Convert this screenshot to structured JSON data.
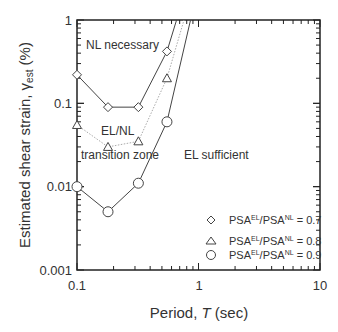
{
  "chart_data": {
    "type": "line",
    "title": "",
    "xlabel": "Period, T (sec)",
    "ylabel": "Estimated shear strain, γest (%)",
    "xscale": "log",
    "yscale": "log",
    "xlim": [
      0.1,
      10
    ],
    "ylim": [
      0.001,
      1
    ],
    "x_ticks": [
      "0.1",
      "1",
      "10"
    ],
    "y_ticks": [
      "0.001",
      "0.01",
      "0.1",
      "1"
    ],
    "grid": false,
    "legend_position": "lower right",
    "series": [
      {
        "name": "PSA^EL/PSA^NL = 0.7",
        "marker": "diamond",
        "line_color": "#444444",
        "x": [
          0.1,
          0.18,
          0.32,
          0.55,
          0.66
        ],
        "y": [
          0.22,
          0.09,
          0.09,
          0.42,
          1.0
        ]
      },
      {
        "name": "PSA^EL/PSA^NL = 0.8",
        "marker": "triangle",
        "line_color": "#aaaaaa",
        "line_style": "dotted",
        "x": [
          0.1,
          0.18,
          0.32,
          0.55,
          0.76
        ],
        "y": [
          0.055,
          0.03,
          0.035,
          0.2,
          1.0
        ]
      },
      {
        "name": "PSA^EL/PSA^NL = 0.9",
        "marker": "circle",
        "line_color": "#444444",
        "x": [
          0.1,
          0.18,
          0.32,
          0.55,
          0.86
        ],
        "y": [
          0.01,
          0.005,
          0.011,
          0.06,
          1.0
        ]
      }
    ],
    "annotations": [
      {
        "text": "NL necessary",
        "x": 0.14,
        "y": 0.5
      },
      {
        "text": "EL/NL",
        "x": 0.15,
        "y": 0.04
      },
      {
        "text": "transition zone",
        "x": 0.11,
        "y": 0.02
      },
      {
        "text": "EL sufficient",
        "x": 1.3,
        "y": 0.018
      }
    ]
  },
  "labels": {
    "xlabel_prefix": "Period, ",
    "xlabel_var": "T",
    "xlabel_suffix": " (sec)",
    "ylabel_prefix": "Estimated shear strain, γ",
    "ylabel_sub": "est",
    "ylabel_suffix": " (%)",
    "tick_x": [
      "0.1",
      "1",
      "10"
    ],
    "tick_y": [
      "1",
      "0.1",
      "0.01",
      "0.001"
    ],
    "ann_nl": "NL necessary",
    "ann_elnl": "EL/NL",
    "ann_trans": "transition zone",
    "ann_el": "EL sufficient",
    "legend": [
      {
        "base": "PSA",
        "sup1": "EL",
        "mid": "/PSA",
        "sup2": "NL",
        "val": " = 0.7"
      },
      {
        "base": "PSA",
        "sup1": "EL",
        "mid": "/PSA",
        "sup2": "NL",
        "val": " = 0.8"
      },
      {
        "base": "PSA",
        "sup1": "EL",
        "mid": "/PSA",
        "sup2": "NL",
        "val": " = 0.9"
      }
    ]
  }
}
